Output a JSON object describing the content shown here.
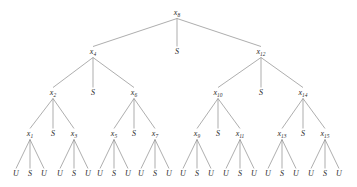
{
  "diagram": {
    "type": "tree",
    "colors": {
      "edge": "#8b8b8b",
      "text": "#2b2b2b",
      "background": "#ffffff"
    },
    "levels": [
      {
        "level": 0,
        "y": 13,
        "nodes": [
          {
            "id": "n8",
            "label": "x",
            "sub": "8",
            "x": 177
          }
        ]
      },
      {
        "level": 1,
        "y": 52,
        "nodes": [
          {
            "id": "n4",
            "label": "x",
            "sub": "4",
            "x": 93
          },
          {
            "id": "s8",
            "label": "S",
            "sub": "",
            "x": 177
          },
          {
            "id": "n12",
            "label": "x",
            "sub": "12",
            "x": 261
          }
        ]
      },
      {
        "level": 2,
        "y": 93,
        "nodes": [
          {
            "id": "n2",
            "label": "x",
            "sub": "2",
            "x": 53
          },
          {
            "id": "s4",
            "label": "S",
            "sub": "",
            "x": 93
          },
          {
            "id": "n6",
            "label": "x",
            "sub": "6",
            "x": 134
          },
          {
            "id": "n10",
            "label": "x",
            "sub": "10",
            "x": 218
          },
          {
            "id": "s12",
            "label": "S",
            "sub": "",
            "x": 261
          },
          {
            "id": "n14",
            "label": "x",
            "sub": "14",
            "x": 303
          }
        ]
      },
      {
        "level": 3,
        "y": 134,
        "nodes": [
          {
            "id": "n1",
            "label": "x",
            "sub": "1",
            "x": 30
          },
          {
            "id": "s2",
            "label": "S",
            "sub": "",
            "x": 53
          },
          {
            "id": "n3",
            "label": "x",
            "sub": "3",
            "x": 74
          },
          {
            "id": "n5",
            "label": "x",
            "sub": "5",
            "x": 114
          },
          {
            "id": "s6",
            "label": "S",
            "sub": "",
            "x": 134
          },
          {
            "id": "n7",
            "label": "x",
            "sub": "7",
            "x": 155
          },
          {
            "id": "n9",
            "label": "x",
            "sub": "9",
            "x": 197
          },
          {
            "id": "s10",
            "label": "S",
            "sub": "",
            "x": 218
          },
          {
            "id": "n11",
            "label": "x",
            "sub": "11",
            "x": 240
          },
          {
            "id": "n13",
            "label": "x",
            "sub": "13",
            "x": 282
          },
          {
            "id": "s14",
            "label": "S",
            "sub": "",
            "x": 303
          },
          {
            "id": "n15",
            "label": "x",
            "sub": "15",
            "x": 325
          }
        ]
      },
      {
        "level": 4,
        "y": 174,
        "nodes": [
          {
            "id": "l1u",
            "label": "U",
            "sub": "",
            "x": 16
          },
          {
            "id": "l1s",
            "label": "S",
            "sub": "",
            "x": 30
          },
          {
            "id": "l1r",
            "label": "U",
            "sub": "",
            "x": 44
          },
          {
            "id": "l3u",
            "label": "U",
            "sub": "",
            "x": 60
          },
          {
            "id": "l3s",
            "label": "S",
            "sub": "",
            "x": 74
          },
          {
            "id": "l3r",
            "label": "U",
            "sub": "",
            "x": 88
          },
          {
            "id": "l5u",
            "label": "U",
            "sub": "",
            "x": 100
          },
          {
            "id": "l5s",
            "label": "S",
            "sub": "",
            "x": 114
          },
          {
            "id": "l5r",
            "label": "U",
            "sub": "",
            "x": 128
          },
          {
            "id": "l7u",
            "label": "U",
            "sub": "",
            "x": 141
          },
          {
            "id": "l7s",
            "label": "S",
            "sub": "",
            "x": 155
          },
          {
            "id": "l7r",
            "label": "U",
            "sub": "",
            "x": 169
          },
          {
            "id": "l9u",
            "label": "U",
            "sub": "",
            "x": 183
          },
          {
            "id": "l9s",
            "label": "S",
            "sub": "",
            "x": 197
          },
          {
            "id": "l9r",
            "label": "U",
            "sub": "",
            "x": 211
          },
          {
            "id": "l11u",
            "label": "U",
            "sub": "",
            "x": 226
          },
          {
            "id": "l11s",
            "label": "S",
            "sub": "",
            "x": 240
          },
          {
            "id": "l11r",
            "label": "U",
            "sub": "",
            "x": 254
          },
          {
            "id": "l13u",
            "label": "U",
            "sub": "",
            "x": 268
          },
          {
            "id": "l13s",
            "label": "S",
            "sub": "",
            "x": 282
          },
          {
            "id": "l13r",
            "label": "U",
            "sub": "",
            "x": 296
          },
          {
            "id": "l15u",
            "label": "U",
            "sub": "",
            "x": 311
          },
          {
            "id": "l15s",
            "label": "S",
            "sub": "",
            "x": 325
          },
          {
            "id": "l15r",
            "label": "U",
            "sub": "",
            "x": 339
          }
        ]
      }
    ],
    "edges": [
      {
        "from": "n8",
        "to": "n4"
      },
      {
        "from": "n8",
        "to": "s8"
      },
      {
        "from": "n8",
        "to": "n12"
      },
      {
        "from": "n4",
        "to": "n2"
      },
      {
        "from": "n4",
        "to": "s4"
      },
      {
        "from": "n4",
        "to": "n6"
      },
      {
        "from": "n12",
        "to": "n10"
      },
      {
        "from": "n12",
        "to": "s12"
      },
      {
        "from": "n12",
        "to": "n14"
      },
      {
        "from": "n2",
        "to": "n1"
      },
      {
        "from": "n2",
        "to": "s2"
      },
      {
        "from": "n2",
        "to": "n3"
      },
      {
        "from": "n6",
        "to": "n5"
      },
      {
        "from": "n6",
        "to": "s6"
      },
      {
        "from": "n6",
        "to": "n7"
      },
      {
        "from": "n10",
        "to": "n9"
      },
      {
        "from": "n10",
        "to": "s10"
      },
      {
        "from": "n10",
        "to": "n11"
      },
      {
        "from": "n14",
        "to": "n13"
      },
      {
        "from": "n14",
        "to": "s14"
      },
      {
        "from": "n14",
        "to": "n15"
      },
      {
        "from": "n1",
        "to": "l1u"
      },
      {
        "from": "n1",
        "to": "l1s"
      },
      {
        "from": "n1",
        "to": "l1r"
      },
      {
        "from": "n3",
        "to": "l3u"
      },
      {
        "from": "n3",
        "to": "l3s"
      },
      {
        "from": "n3",
        "to": "l3r"
      },
      {
        "from": "n5",
        "to": "l5u"
      },
      {
        "from": "n5",
        "to": "l5s"
      },
      {
        "from": "n5",
        "to": "l5r"
      },
      {
        "from": "n7",
        "to": "l7u"
      },
      {
        "from": "n7",
        "to": "l7s"
      },
      {
        "from": "n7",
        "to": "l7r"
      },
      {
        "from": "n9",
        "to": "l9u"
      },
      {
        "from": "n9",
        "to": "l9s"
      },
      {
        "from": "n9",
        "to": "l9r"
      },
      {
        "from": "n11",
        "to": "l11u"
      },
      {
        "from": "n11",
        "to": "l11s"
      },
      {
        "from": "n11",
        "to": "l11r"
      },
      {
        "from": "n13",
        "to": "l13u"
      },
      {
        "from": "n13",
        "to": "l13s"
      },
      {
        "from": "n13",
        "to": "l13r"
      },
      {
        "from": "n15",
        "to": "l15u"
      },
      {
        "from": "n15",
        "to": "l15s"
      },
      {
        "from": "n15",
        "to": "l15r"
      }
    ]
  }
}
